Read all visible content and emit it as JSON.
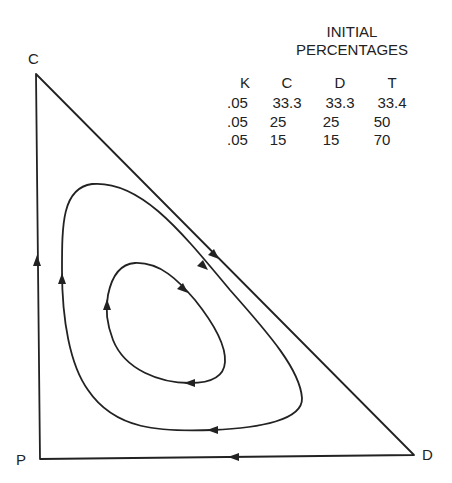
{
  "vertices": {
    "top": "C",
    "bottom_left": "P",
    "bottom_right": "D"
  },
  "table": {
    "title_line1": "INITIAL",
    "title_line2": "PERCENTAGES",
    "headers": [
      "K",
      "C",
      "D",
      "T"
    ],
    "rows": [
      [
        ".05",
        "33.3",
        "33.3",
        "33.4"
      ],
      [
        ".05",
        "25",
        "25",
        "50"
      ],
      [
        ".05",
        "15",
        "15",
        "70"
      ]
    ]
  },
  "trajectories": [
    {
      "name": "outer-boundary",
      "direction": "C to D to P to C"
    },
    {
      "name": "outer-loop",
      "direction": "clockwise"
    },
    {
      "name": "inner-loop",
      "direction": "clockwise"
    }
  ],
  "colors": {
    "line": "#222222",
    "background": "#ffffff"
  }
}
